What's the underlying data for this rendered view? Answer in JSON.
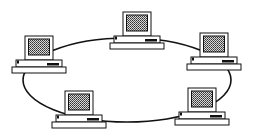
{
  "diagram": {
    "type": "ring-network-topology",
    "background": "#ffffff",
    "line_color": "#111111",
    "screen_fill": "#9a9a9a",
    "ring": {
      "cx": 127,
      "cy": 80,
      "rx": 104,
      "ry": 42
    },
    "nodes": [
      {
        "id": "computer-top",
        "x": 110,
        "y": 12
      },
      {
        "id": "computer-left",
        "x": 12,
        "y": 36
      },
      {
        "id": "computer-right",
        "x": 187,
        "y": 33
      },
      {
        "id": "computer-bottom-left",
        "x": 52,
        "y": 91
      },
      {
        "id": "computer-bottom-right",
        "x": 175,
        "y": 88
      }
    ]
  }
}
